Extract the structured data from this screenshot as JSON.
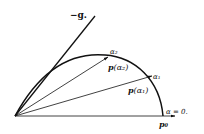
{
  "diagram": {
    "labels": {
      "neg_g": "−g",
      "neg_g_suffix": ".",
      "alpha2": "α₂",
      "p_alpha2_p": "p",
      "p_alpha2_arg": "(α₂)",
      "alpha1": "α₁",
      "p_alpha1_p": "p",
      "p_alpha1_arg": "(α₁)",
      "alpha0": "α = 0.",
      "p0": "p₀"
    },
    "colors": {
      "ink": "#111111",
      "background": "#ffffff"
    }
  }
}
